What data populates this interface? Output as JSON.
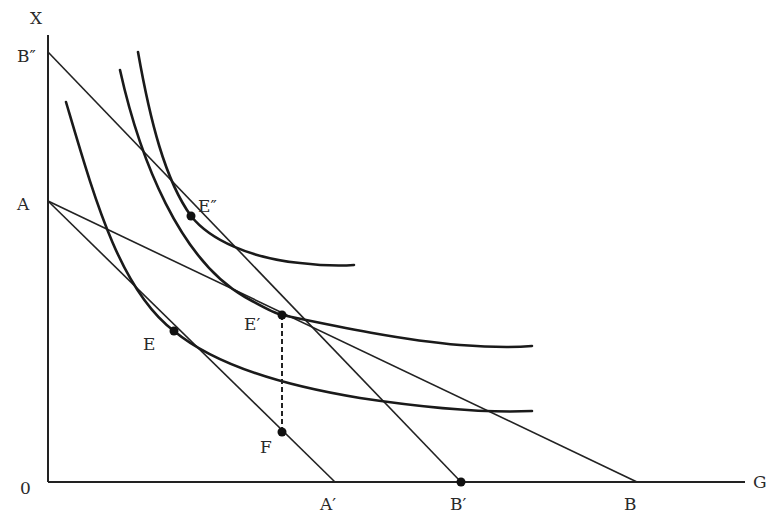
{
  "diagram": {
    "type": "indifference-curve-budget-line",
    "axes": {
      "y_label": "X",
      "x_label": "G",
      "origin_label": "0"
    },
    "y_intercepts": [
      {
        "id": "B2",
        "label": "B″"
      },
      {
        "id": "A",
        "label": "A"
      }
    ],
    "x_intercepts": [
      {
        "id": "A1",
        "label": "A′"
      },
      {
        "id": "B1",
        "label": "B′"
      },
      {
        "id": "B",
        "label": "B"
      }
    ],
    "points": [
      {
        "id": "E",
        "label": "E"
      },
      {
        "id": "E1",
        "label": "E′"
      },
      {
        "id": "E2",
        "label": "E″"
      },
      {
        "id": "F",
        "label": "F"
      }
    ],
    "budget_lines": [
      {
        "from": "A",
        "to": "A′"
      },
      {
        "from": "A",
        "to": "B"
      },
      {
        "from": "B″",
        "to": "B′"
      }
    ],
    "indifference_curves": [
      {
        "name": "IC1",
        "tangent_at": "E"
      },
      {
        "name": "IC2",
        "tangent_at": "E′"
      },
      {
        "name": "IC3",
        "tangent_at": "E″"
      }
    ],
    "dashed_segment": {
      "from": "E′",
      "to": "F"
    }
  }
}
